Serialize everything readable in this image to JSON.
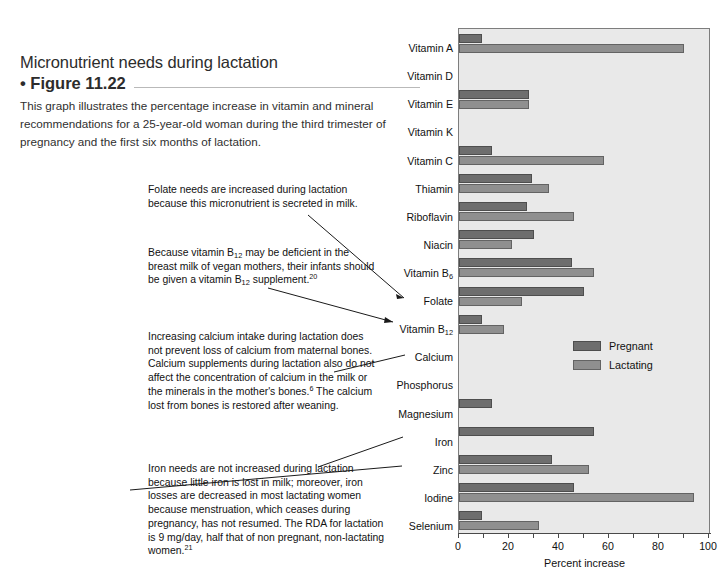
{
  "figure": {
    "title": "Micronutrient needs during lactation",
    "number": "• Figure 11.22",
    "caption": "This graph illustrates the percentage increase in vitamin and mineral recommendations for a 25-year-old woman during the third trimester of pregnancy and the first six months of lactation."
  },
  "annotations": {
    "folate": "Folate needs are increased during lactation because this micronutrient is secreted in milk.",
    "b12_part1": "Because vitamin B",
    "b12_sub1": "12",
    "b12_part2": " may be deficient in the breast milk of vegan mothers, their infants should be given a vitamin B",
    "b12_sub2": "12",
    "b12_part3": " supplement.",
    "b12_sup": "20",
    "calcium_part1": "Increasing calcium intake during lactation does not prevent loss of calcium from maternal  bones. Calcium supplements during lactation also do not affect the concentration of calcium in the milk or the minerals in the mother's bones.",
    "calcium_sup": "6",
    "calcium_part2": " The calcium lost from bones is restored after weaning.",
    "iron_part1": "Iron needs are not increased during lactation because little iron is lost in milk; moreover, iron losses are decreased in most lactating women because menstruation, which ceases during pregnancy, has not resumed. The RDA for lactation is 9 mg/day, half that of non pregnant, non-lactating women.",
    "iron_sup": "21"
  },
  "legend": {
    "items": [
      {
        "label": "Pregnant",
        "color": "#6e6e6e"
      },
      {
        "label": "Lactating",
        "color": "#8f8f8f"
      }
    ]
  },
  "chart_data": {
    "type": "bar",
    "orientation": "horizontal",
    "title": "Micronutrient needs during lactation",
    "xlabel": "Percent increase",
    "ylabel": "",
    "xlim": [
      0,
      100
    ],
    "xticks": [
      0,
      20,
      40,
      60,
      80,
      100
    ],
    "xtick_labels": [
      "0",
      "20",
      "40",
      "60",
      "80",
      "100"
    ],
    "minor_tick_step": 10,
    "grid": false,
    "legend_position": "inside-right-middle",
    "categories": [
      "Vitamin A",
      "Vitamin D",
      "Vitamin E",
      "Vitamin K",
      "Vitamin C",
      "Thiamin",
      "Riboflavin",
      "Niacin",
      "Vitamin B6",
      "Folate",
      "Vitamin B12",
      "Calcium",
      "Phosphorus",
      "Magnesium",
      "Iron",
      "Zinc",
      "Iodine",
      "Selenium"
    ],
    "category_labels_html": [
      "Vitamin A",
      "Vitamin D",
      "Vitamin E",
      "Vitamin K",
      "Vitamin C",
      "Thiamin",
      "Riboflavin",
      "Niacin",
      "Vitamin B<sub>6</sub>",
      "Folate",
      "Vitamin B<sub>12</sub>",
      "Calcium",
      "Phosphorus",
      "Magnesium",
      "Iron",
      "Zinc",
      "Iodine",
      "Selenium"
    ],
    "series": [
      {
        "name": "Pregnant",
        "color": "#6e6e6e",
        "values": [
          9,
          0,
          28,
          0,
          13,
          29,
          27,
          30,
          45,
          50,
          9,
          0,
          0,
          13,
          54,
          37,
          46,
          9
        ]
      },
      {
        "name": "Lactating",
        "color": "#8f8f8f",
        "values": [
          90,
          0,
          28,
          0,
          58,
          36,
          46,
          21,
          54,
          25,
          18,
          0,
          0,
          0,
          0,
          52,
          94,
          32
        ]
      }
    ]
  }
}
